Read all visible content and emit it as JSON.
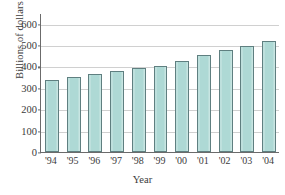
{
  "chart_data": {
    "type": "bar",
    "title": "",
    "xlabel": "Year",
    "ylabel": "Billions of dollars",
    "categories": [
      "'94",
      "'95",
      "'96",
      "'97",
      "'98",
      "'99",
      "'00",
      "'01",
      "'02",
      "'03",
      "'04"
    ],
    "values": [
      335,
      350,
      365,
      380,
      392,
      404,
      425,
      452,
      477,
      496,
      519
    ],
    "ylim": [
      0,
      650
    ],
    "yticks": [
      0,
      100,
      200,
      300,
      400,
      500,
      600
    ],
    "ytick_labels": [
      "0",
      "100",
      "200",
      "300",
      "400",
      "500",
      "600"
    ],
    "grid": true,
    "legend": "none",
    "colors": {
      "bar_fill": "#aed9d5",
      "bar_edge": "#5f7f80",
      "gridline": "#d0d0d0",
      "axis": "#6b6b6b",
      "text": "#3b3b3b",
      "background": "#ffffff"
    }
  }
}
